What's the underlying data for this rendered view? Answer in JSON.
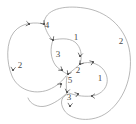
{
  "figure": {
    "kind": "directed-graph-diagram",
    "width": 136,
    "height": 124,
    "background_color": "#ffffff",
    "curve_color": "#9a9a9a",
    "marker_color": "#4a4a4a",
    "label_color": "#4a4a4a"
  },
  "labels": [
    {
      "id": "label-vertex-4",
      "text": "4",
      "x": 47,
      "y": 25
    },
    {
      "id": "label-region-top-1",
      "text": "1",
      "x": 76,
      "y": 37
    },
    {
      "id": "label-region-right-2",
      "text": "2",
      "x": 121,
      "y": 41
    },
    {
      "id": "label-region-3",
      "text": "3",
      "x": 58,
      "y": 54
    },
    {
      "id": "label-region-left-2",
      "text": "2",
      "x": 20,
      "y": 65
    },
    {
      "id": "label-vertex-2",
      "text": "2",
      "x": 78,
      "y": 70
    },
    {
      "id": "label-vertex-5",
      "text": "5",
      "x": 70,
      "y": 80
    },
    {
      "id": "label-region-right-1",
      "text": "1",
      "x": 100,
      "y": 78
    },
    {
      "id": "label-vertex-3",
      "text": "3",
      "x": 69,
      "y": 97
    }
  ],
  "curves": [
    {
      "id": "curve-outer-right-lobe",
      "d": "M 44 24 C 44 9 64 5 84 8 C 106 11 124 26 129 48 C 134 72 126 98 108 112 C 92 124 70 120 64 110 C 59 102 62 96 68 94"
    },
    {
      "id": "curve-left-lobe",
      "d": "M 44 24 C 36 22 22 22 14 32 C 6 42 6 62 12 76 C 18 90 34 95 48 90 C 58 86 63 80 66 76"
    },
    {
      "id": "curve-upper-center-link",
      "d": "M 44 24 C 46 30 48 36 53 40"
    },
    {
      "id": "curve-upper-right-arc",
      "d": "M 53 40 C 62 38 72 38 77 44 C 82 50 82 58 80 64"
    },
    {
      "id": "curve-inner-left-arc",
      "d": "M 53 40 C 50 48 50 58 56 66 C 60 70 64 72 67 74"
    },
    {
      "id": "curve-center-descend",
      "d": "M 80 64 C 76 68 72 71 68 74"
    },
    {
      "id": "curve-center-to-lower",
      "d": "M 67 76 C 66 82 66 88 67 92"
    },
    {
      "id": "curve-right-inner-loop",
      "d": "M 80 64 C 90 60 102 64 106 74 C 110 84 104 94 92 96 C 82 97 74 95 69 93"
    },
    {
      "id": "curve-lower-outer",
      "d": "M 67 93 C 62 98 54 104 46 106 C 38 108 30 104 28 98"
    }
  ],
  "markers": [
    {
      "id": "marker-top-left-arc",
      "x": 29,
      "y": 24,
      "angle": 8
    },
    {
      "id": "marker-vertex-4",
      "x": 44,
      "y": 24,
      "angle": 50
    },
    {
      "id": "marker-vertex-mid-up",
      "x": 53,
      "y": 40,
      "angle": 62
    },
    {
      "id": "marker-top-right",
      "x": 80,
      "y": 56,
      "angle": 100
    },
    {
      "id": "marker-right-upper",
      "x": 93,
      "y": 62,
      "angle": 340
    },
    {
      "id": "marker-vertex-2",
      "x": 80,
      "y": 64,
      "angle": 130
    },
    {
      "id": "marker-vertex-5-left",
      "x": 62,
      "y": 70,
      "angle": 35
    },
    {
      "id": "marker-vertex-5-top",
      "x": 68,
      "y": 74,
      "angle": 118
    },
    {
      "id": "marker-vertex-5-sw",
      "x": 61,
      "y": 84,
      "angle": 318
    },
    {
      "id": "marker-vertex-3-top",
      "x": 67,
      "y": 92,
      "angle": 100
    },
    {
      "id": "marker-vertex-3-east",
      "x": 78,
      "y": 94,
      "angle": 345
    },
    {
      "id": "marker-lower-right",
      "x": 92,
      "y": 96,
      "angle": 182
    },
    {
      "id": "marker-lower-bottom",
      "x": 70,
      "y": 106,
      "angle": 95
    },
    {
      "id": "marker-left-lobe-low",
      "x": 13,
      "y": 70,
      "angle": 95
    }
  ]
}
